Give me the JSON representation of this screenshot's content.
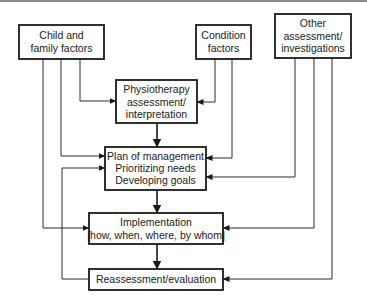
{
  "diagram": {
    "type": "flowchart",
    "colors": {
      "stroke": "#1a1a1a",
      "background": "#ffffff",
      "top_rule": "#8a8a8a"
    },
    "nodes": {
      "child_family": {
        "lines": [
          "Child and",
          "family factors"
        ]
      },
      "condition": {
        "lines": [
          "Condition",
          "factors"
        ]
      },
      "other_assessment": {
        "lines": [
          "Other",
          "assessment/",
          "investigations"
        ]
      },
      "physiotherapy": {
        "lines": [
          "Physiotherapy",
          "assessment/",
          "interpretation"
        ]
      },
      "plan": {
        "lines": [
          "Plan of management",
          "Prioritizing needs",
          "Developing goals"
        ]
      },
      "implementation": {
        "lines": [
          "Implementation",
          "[how, when, where, by whom]"
        ]
      },
      "reassessment": {
        "lines": [
          "Reassessment/evaluation"
        ]
      }
    },
    "edges": [
      {
        "from": "child_family",
        "to": "physiotherapy"
      },
      {
        "from": "child_family",
        "to": "plan"
      },
      {
        "from": "child_family",
        "to": "implementation"
      },
      {
        "from": "condition",
        "to": "physiotherapy"
      },
      {
        "from": "condition",
        "to": "plan"
      },
      {
        "from": "other_assessment",
        "to": "plan"
      },
      {
        "from": "other_assessment",
        "to": "implementation"
      },
      {
        "from": "reassessment",
        "to": "other_assessment",
        "bidirectional": true
      },
      {
        "from": "physiotherapy",
        "to": "plan"
      },
      {
        "from": "plan",
        "to": "implementation"
      },
      {
        "from": "implementation",
        "to": "reassessment"
      },
      {
        "from": "reassessment",
        "to": "plan"
      }
    ]
  }
}
